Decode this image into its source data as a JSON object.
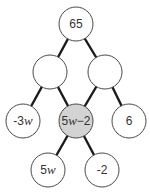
{
  "diagram": {
    "type": "number-pyramid-tree",
    "nodes": [
      {
        "id": "top",
        "label": "65",
        "x": 76,
        "y": 24,
        "shaded": false
      },
      {
        "id": "mid-left",
        "label": "",
        "x": 50,
        "y": 72,
        "shaded": false
      },
      {
        "id": "mid-right",
        "label": "",
        "x": 105,
        "y": 72,
        "shaded": false
      },
      {
        "id": "row3-left",
        "label": "-3w",
        "x": 23,
        "y": 121,
        "shaded": false
      },
      {
        "id": "row3-center",
        "label": "5w−2",
        "x": 76,
        "y": 121,
        "shaded": true
      },
      {
        "id": "row3-right",
        "label": "6",
        "x": 129,
        "y": 121,
        "shaded": false
      },
      {
        "id": "bottom-left",
        "label": "5w",
        "x": 48,
        "y": 170,
        "shaded": false
      },
      {
        "id": "bottom-right",
        "label": "-2",
        "x": 102,
        "y": 170,
        "shaded": false
      }
    ],
    "edges": [
      [
        "top",
        "mid-left"
      ],
      [
        "top",
        "mid-right"
      ],
      [
        "mid-left",
        "row3-left"
      ],
      [
        "mid-left",
        "row3-center"
      ],
      [
        "mid-right",
        "row3-center"
      ],
      [
        "mid-right",
        "row3-right"
      ],
      [
        "row3-center",
        "bottom-left"
      ],
      [
        "row3-center",
        "bottom-right"
      ]
    ],
    "colors": {
      "shaded_fill": "#d3d3d3",
      "fill": "#ffffff",
      "stroke": "#4a4a4a",
      "edge": "#1a1a1a"
    },
    "radius": 17
  }
}
